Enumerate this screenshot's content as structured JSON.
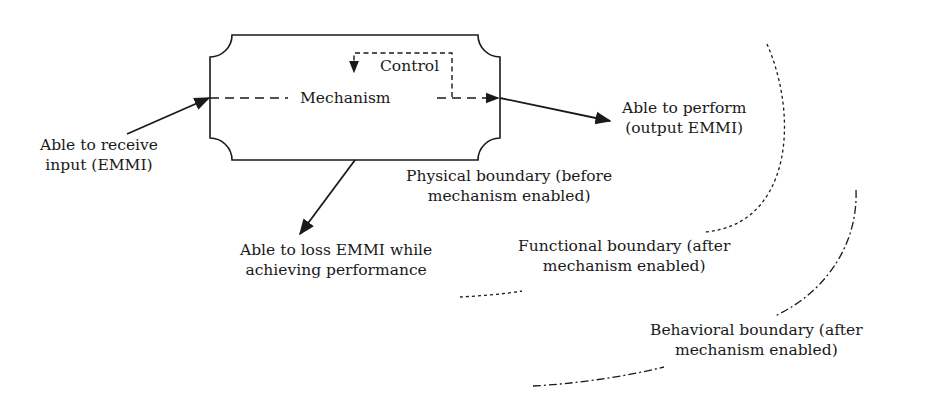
{
  "diagram": {
    "box": {
      "mechanism_label": "Mechanism",
      "control_label": "Control"
    },
    "labels": {
      "input": [
        "Able to receive",
        "input (EMMI)"
      ],
      "output": [
        "Able to perform",
        "(output EMMI)"
      ],
      "loss": [
        "Able to loss EMMI while",
        "achieving performance"
      ],
      "physical": [
        "Physical boundary (before",
        "mechanism enabled)"
      ],
      "functional": [
        "Functional boundary (after",
        "mechanism enabled)"
      ],
      "behavioral": [
        "Behavioral boundary (after",
        "mechanism enabled)"
      ]
    },
    "colors": {
      "stroke": "#1a1a1a",
      "background": "#ffffff"
    }
  }
}
